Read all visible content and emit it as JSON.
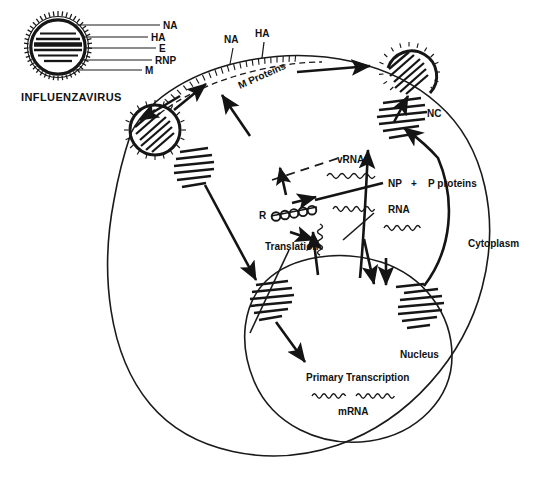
{
  "figure": {
    "type": "biological-schematic",
    "background_color": "#ffffff",
    "ink_color": "#161616"
  },
  "virion_key": {
    "caption": "INFLUENZAVIRUS",
    "labels": [
      {
        "id": "na",
        "text": "NA"
      },
      {
        "id": "ha",
        "text": "HA"
      },
      {
        "id": "e",
        "text": "E"
      },
      {
        "id": "rnp",
        "text": "RNP"
      },
      {
        "id": "m",
        "text": "M"
      }
    ]
  },
  "membrane_labels": {
    "na": "NA",
    "ha": "HA",
    "m_proteins": "M Proteins"
  },
  "cell_labels": {
    "cytoplasm": "Cytoplasm",
    "nucleus": "Nucleus"
  },
  "pathway_labels": {
    "nc": "NC",
    "vrna": "vRNA",
    "np": "NP",
    "plus": "+",
    "p_proteins": "P proteins",
    "rna": "RNA",
    "ribosome": "R",
    "translation": "Translation",
    "primary_transcription": "Primary Transcription",
    "mrna": "mRNA"
  }
}
